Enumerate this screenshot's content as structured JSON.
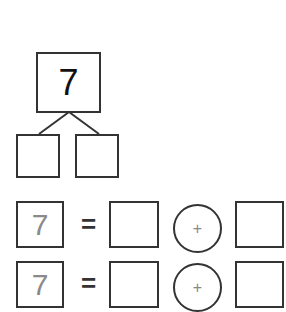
{
  "number_bond": {
    "whole": "7",
    "parts": [
      "",
      ""
    ]
  },
  "equations": [
    {
      "total": "7",
      "equals": "=",
      "addend1": "",
      "operator": "+",
      "addend2": ""
    },
    {
      "total": "7",
      "equals": "=",
      "addend1": "",
      "operator": "+",
      "addend2": ""
    }
  ],
  "colors": {
    "stroke": "#333333",
    "whole_text": "#111111",
    "total_text": "#8a8a8a",
    "operator_text": "#888888"
  }
}
